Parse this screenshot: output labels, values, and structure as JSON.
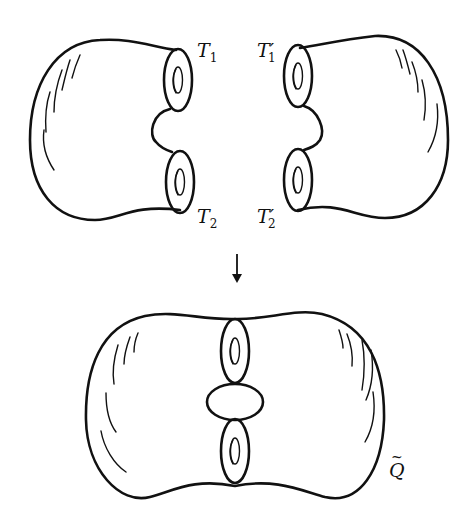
{
  "figure": {
    "type": "topology-diagram"
  },
  "labels": {
    "t1": {
      "base": "T",
      "sub": "1",
      "prime": ""
    },
    "t2": {
      "base": "T",
      "sub": "2",
      "prime": ""
    },
    "t1p": {
      "base": "T",
      "sub": "1",
      "prime": "′"
    },
    "t2p": {
      "base": "T",
      "sub": "2",
      "prime": "′"
    },
    "q": {
      "base": "Q",
      "accent": "~"
    }
  },
  "arrow": {
    "direction": "down"
  },
  "colors": {
    "stroke": "#111111",
    "background": "#ffffff"
  }
}
